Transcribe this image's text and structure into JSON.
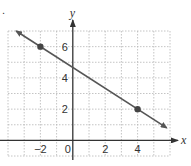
{
  "chart_data": {
    "type": "line",
    "title": "",
    "xlabel": "x",
    "ylabel": "y",
    "xlim": [
      -4,
      6
    ],
    "ylim": [
      -1,
      7
    ],
    "grid": true,
    "x_ticks": [
      -2,
      0,
      2,
      4
    ],
    "x_tick_labels": [
      "−2",
      "0",
      "2",
      "4"
    ],
    "y_ticks": [
      2,
      4,
      6
    ],
    "y_tick_labels": [
      "2",
      "4",
      "6"
    ],
    "points": [
      {
        "x": -2,
        "y": 6
      },
      {
        "x": 4,
        "y": 2
      }
    ],
    "line": {
      "slope": -0.6667,
      "intercept": 4.6667,
      "x_start": -3.5,
      "x_end": 5.8,
      "arrows": "both"
    },
    "colors": {
      "line": "#555555",
      "point": "#444444",
      "axis": "#333333",
      "grid": "#b5b5b5"
    }
  },
  "bullet": "."
}
